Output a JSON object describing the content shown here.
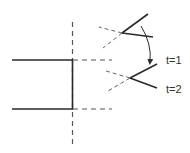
{
  "diagram": {
    "labels": {
      "t1": "t=1",
      "t2": "t=2"
    },
    "colors": {
      "solid": "#2a2a2a",
      "dashed": "#555555",
      "background": "#ffffff"
    }
  }
}
